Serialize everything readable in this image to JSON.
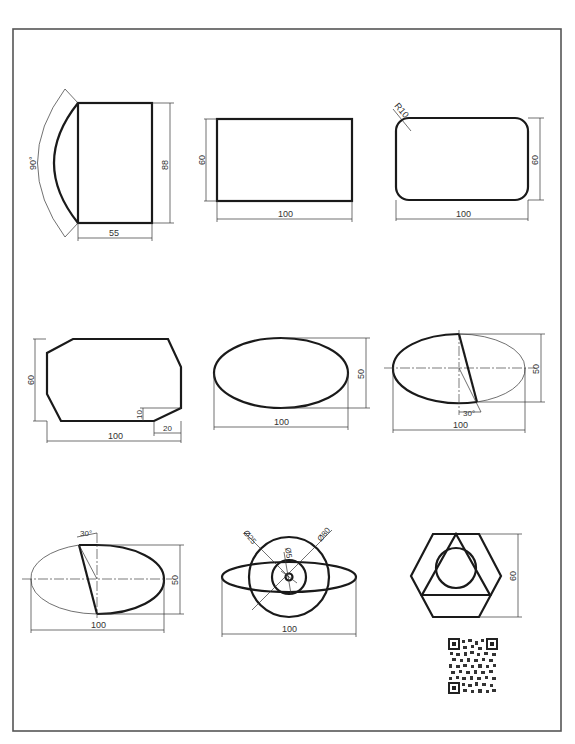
{
  "sheet": {
    "title": "Geometric construction exercise sheet",
    "colors": {
      "line": "#1a1a1a",
      "dim": "#333333",
      "frame": "#555555",
      "background": "#ffffff"
    }
  },
  "figures": [
    {
      "id": 1,
      "name": "rectangle-with-arc",
      "dims": {
        "angle": "90°",
        "height": "88",
        "width": "55"
      }
    },
    {
      "id": 2,
      "name": "rectangle",
      "dims": {
        "height": "60",
        "width": "100"
      }
    },
    {
      "id": 3,
      "name": "rounded-rectangle",
      "dims": {
        "radius": "R10",
        "height": "60",
        "width": "100"
      }
    },
    {
      "id": 4,
      "name": "chamfered-octagon",
      "dims": {
        "height": "60",
        "width": "100",
        "chamfer_v": "10",
        "chamfer_h": "20"
      }
    },
    {
      "id": 5,
      "name": "ellipse",
      "dims": {
        "height": "50",
        "width": "100"
      }
    },
    {
      "id": 6,
      "name": "ellipse-with-angled-diameter-lower",
      "dims": {
        "height": "50",
        "width": "100",
        "angle": "30°"
      }
    },
    {
      "id": 7,
      "name": "ellipse-with-angled-diameter-upper",
      "dims": {
        "height": "50",
        "width": "100",
        "angle": "30°"
      }
    },
    {
      "id": 8,
      "name": "concentric-circles-with-ellipse",
      "dims": {
        "d_large": "Ø80",
        "d_mid": "Ø25",
        "d_small": "Ø5",
        "width": "100"
      }
    },
    {
      "id": 9,
      "name": "hexagon-triangle-circle",
      "dims": {
        "height": "60"
      }
    }
  ],
  "qr_code": {
    "label": "qr-code"
  }
}
